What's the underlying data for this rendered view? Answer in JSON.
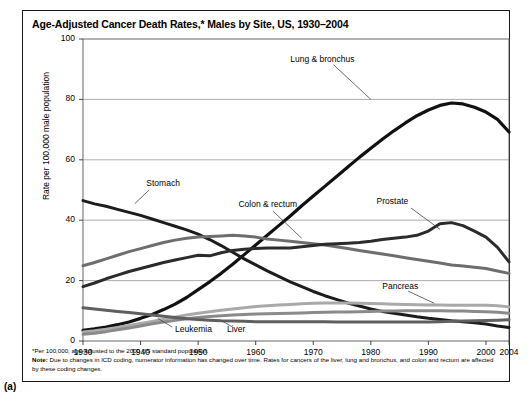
{
  "figure": {
    "panel_label": "(a)",
    "title": "Age-Adjusted Cancer Death Rates,* Males by Site, US, 1930–2004",
    "footnote_star": "*Per 100,000, age-adjusted to the 2000 US standard population.",
    "note_bold": "Note:",
    "note_text": " Due to changes in ICD coding, numerator information has changed over time. Rates for cancers of the liver, lung and bronchus, and colon and rectum are affected by these coding changes."
  },
  "chart_data": {
    "type": "line",
    "title": "Age-Adjusted Cancer Death Rates,* Males by Site, US, 1930–2004",
    "xlabel": "",
    "ylabel": "Rate per 100,000 male population",
    "xlim": [
      1930,
      2004
    ],
    "ylim": [
      0,
      100
    ],
    "grid": "horizontal",
    "legend": "inline-annotations",
    "xticks": [
      1930,
      1940,
      1950,
      1960,
      1970,
      1980,
      1990,
      2000,
      2004
    ],
    "xticklabels": [
      "1930",
      "1940",
      "1950",
      "1960",
      "1970",
      "1980",
      "1990",
      "2000",
      "2004"
    ],
    "yticks": [
      0,
      20,
      40,
      60,
      80,
      100
    ],
    "yticklabels": [
      "0",
      "20",
      "40",
      "60",
      "80",
      "100"
    ],
    "x": [
      1930,
      1932,
      1934,
      1936,
      1938,
      1940,
      1942,
      1944,
      1946,
      1948,
      1950,
      1952,
      1954,
      1956,
      1958,
      1960,
      1962,
      1964,
      1966,
      1968,
      1970,
      1972,
      1974,
      1976,
      1978,
      1980,
      1982,
      1984,
      1986,
      1988,
      1990,
      1992,
      1994,
      1996,
      1998,
      2000,
      2002,
      2004
    ],
    "series": [
      {
        "name": "Lung & bronchus",
        "color": "#111111",
        "width": 3.2,
        "label_x": 1966,
        "label_y": 93,
        "values": [
          3.5,
          4.0,
          4.6,
          5.4,
          6.3,
          7.5,
          8.8,
          10.4,
          12.2,
          14.4,
          17.0,
          19.6,
          22.4,
          25.4,
          28.6,
          31.8,
          35.0,
          38.2,
          41.4,
          44.8,
          48.0,
          51.2,
          54.4,
          57.6,
          60.8,
          63.8,
          66.8,
          69.6,
          72.2,
          74.6,
          76.5,
          78.0,
          78.8,
          78.5,
          77.4,
          75.8,
          73.4,
          69.2
        ]
      },
      {
        "name": "Stomach",
        "color": "#1c1c1c",
        "width": 3.0,
        "label_x": 1941,
        "label_y": 52,
        "values": [
          46.5,
          45.4,
          44.6,
          43.6,
          42.6,
          41.6,
          40.4,
          39.2,
          38.0,
          36.8,
          35.4,
          33.6,
          31.6,
          29.4,
          27.2,
          25.2,
          23.2,
          21.4,
          19.6,
          18.0,
          16.4,
          15.0,
          13.8,
          12.6,
          11.6,
          10.6,
          9.8,
          9.2,
          8.6,
          8.0,
          7.5,
          7.1,
          6.7,
          6.4,
          6.0,
          5.6,
          5.0,
          4.5
        ]
      },
      {
        "name": "Colon & rectum",
        "color": "#6e6e6e",
        "width": 3.0,
        "label_x": 1957,
        "label_y": 45,
        "values": [
          24.9,
          26.0,
          27.2,
          28.4,
          29.6,
          30.6,
          31.6,
          32.6,
          33.4,
          34.0,
          34.4,
          34.6,
          34.8,
          35.0,
          34.8,
          34.4,
          33.8,
          33.4,
          33.0,
          32.6,
          32.2,
          31.8,
          31.2,
          30.6,
          30.0,
          29.4,
          28.8,
          28.2,
          27.6,
          27.0,
          26.4,
          25.8,
          25.2,
          24.8,
          24.4,
          24.0,
          23.2,
          22.4
        ]
      },
      {
        "name": "Prostate",
        "color": "#2b2b2b",
        "width": 3.0,
        "label_x": 1981,
        "label_y": 46,
        "values": [
          18.0,
          19.2,
          20.6,
          21.8,
          23.0,
          24.0,
          25.0,
          26.0,
          26.8,
          27.6,
          28.4,
          28.2,
          29.2,
          30.0,
          30.4,
          30.6,
          30.8,
          30.8,
          30.8,
          31.2,
          31.6,
          32.0,
          32.2,
          32.4,
          32.6,
          33.0,
          33.6,
          34.0,
          34.4,
          35.0,
          36.4,
          38.8,
          39.2,
          38.2,
          36.4,
          34.4,
          31.0,
          26.2
        ]
      },
      {
        "name": "Pancreas",
        "color": "#a9a9a9",
        "width": 3.0,
        "label_x": 1982,
        "label_y": 18,
        "values": [
          3.0,
          3.4,
          3.9,
          4.5,
          5.1,
          5.8,
          6.5,
          7.2,
          7.9,
          8.6,
          9.2,
          9.7,
          10.2,
          10.6,
          11.0,
          11.4,
          11.7,
          11.9,
          12.1,
          12.3,
          12.5,
          12.6,
          12.6,
          12.6,
          12.5,
          12.4,
          12.3,
          12.2,
          12.1,
          12.0,
          11.9,
          11.9,
          11.8,
          11.8,
          11.8,
          11.8,
          11.7,
          11.3
        ]
      },
      {
        "name": "Leukemia",
        "color": "#8a8a8a",
        "width": 3.0,
        "label_x": 1946,
        "label_y": 3.5,
        "values": [
          2.2,
          2.6,
          3.1,
          3.7,
          4.3,
          5.0,
          5.7,
          6.3,
          6.9,
          7.4,
          7.8,
          8.1,
          8.4,
          8.6,
          8.8,
          8.9,
          9.0,
          9.1,
          9.2,
          9.3,
          9.4,
          9.5,
          9.6,
          9.6,
          9.7,
          9.8,
          9.9,
          9.9,
          10.0,
          10.0,
          10.0,
          10.0,
          9.9,
          9.9,
          9.8,
          9.7,
          9.5,
          9.2
        ]
      },
      {
        "name": "Liver",
        "color": "#5f5f5f",
        "width": 3.0,
        "label_x": 1955,
        "label_y": 3.5,
        "values": [
          11.0,
          10.6,
          10.2,
          9.8,
          9.4,
          9.0,
          8.6,
          8.2,
          7.8,
          7.4,
          7.1,
          6.9,
          6.7,
          6.6,
          6.5,
          6.4,
          6.4,
          6.4,
          6.4,
          6.4,
          6.4,
          6.4,
          6.3,
          6.3,
          6.3,
          6.3,
          6.3,
          6.3,
          6.3,
          6.3,
          6.3,
          6.4,
          6.5,
          6.6,
          6.7,
          6.8,
          6.9,
          7.0
        ]
      }
    ]
  }
}
